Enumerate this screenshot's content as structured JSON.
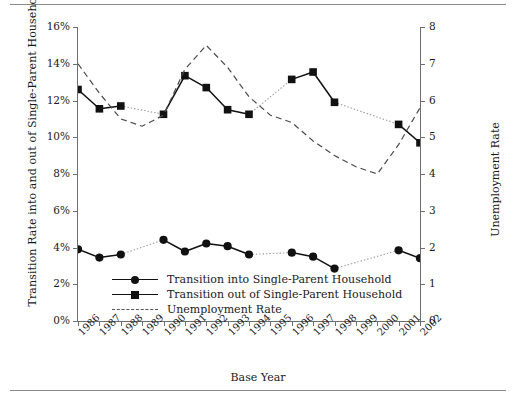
{
  "axes": {
    "xlabel": "Base Year",
    "ylabel_left": "Transition Rate into and out of Single-Parent Households",
    "ylabel_right": "Unemployment Rate",
    "yticks_left": [
      "0%",
      "2%",
      "4%",
      "6%",
      "8%",
      "10%",
      "12%",
      "14%",
      "16%"
    ],
    "yticks_right": [
      "0",
      "1",
      "2",
      "3",
      "4",
      "5",
      "6",
      "7",
      "8"
    ],
    "xticks": [
      "1986",
      "1987",
      "1988",
      "1989",
      "1990",
      "1991",
      "1992",
      "1993",
      "1994",
      "1995",
      "1996",
      "1997",
      "1998",
      "1999",
      "2000",
      "2001",
      "2002"
    ]
  },
  "legend": {
    "items": [
      {
        "label": "Transition into Single-Parent Household",
        "marker": "circle",
        "style": "solid"
      },
      {
        "label": "Transition out of Single-Parent Household",
        "marker": "square",
        "style": "solid"
      },
      {
        "label": "Unemployment Rate",
        "marker": "none",
        "style": "dashed"
      }
    ]
  },
  "chart_data": {
    "type": "line",
    "title": "",
    "xlabel": "Base Year",
    "ylabel": "Transition Rate into and out of Single-Parent Households",
    "ylabel_secondary": "Unemployment Rate",
    "ylim": [
      0,
      16
    ],
    "ylim_secondary": [
      0,
      8
    ],
    "ytick_step": 2,
    "ytick_step_secondary": 1,
    "grid": false,
    "legend_position": "inside-lower-left",
    "x": [
      "1986",
      "1987",
      "1988",
      "1989",
      "1990",
      "1991",
      "1992",
      "1993",
      "1994",
      "1995",
      "1996",
      "1997",
      "1998",
      "1999",
      "2000",
      "2001",
      "2002"
    ],
    "series": [
      {
        "name": "Transition into Single-Parent Household",
        "axis": "left",
        "units": "percent",
        "marker": "circle",
        "values": [
          3.9,
          3.45,
          3.62,
          null,
          4.42,
          3.78,
          4.22,
          4.07,
          3.62,
          null,
          3.72,
          3.5,
          2.85,
          null,
          null,
          3.85,
          3.42
        ]
      },
      {
        "name": "Transition out of Single-Parent Household",
        "axis": "left",
        "units": "percent",
        "marker": "square",
        "values": [
          12.6,
          11.55,
          11.7,
          null,
          11.25,
          13.35,
          12.7,
          11.5,
          11.25,
          null,
          13.15,
          13.55,
          11.9,
          null,
          null,
          10.7,
          9.7
        ]
      },
      {
        "name": "Unemployment Rate",
        "axis": "right",
        "units": "rate",
        "marker": "none",
        "style": "dashed",
        "values": [
          7.0,
          6.2,
          5.5,
          5.3,
          5.6,
          6.85,
          7.5,
          6.9,
          6.1,
          5.6,
          5.4,
          4.9,
          4.5,
          4.2,
          4.0,
          4.8,
          5.8
        ]
      }
    ]
  }
}
